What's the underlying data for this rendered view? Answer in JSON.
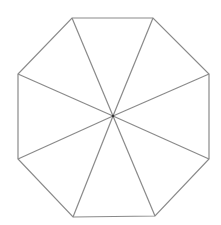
{
  "diagram": {
    "shape": "octagon divided into 8 triangles from center",
    "canvas": {
      "width": 221,
      "height": 225,
      "background": "#ffffff"
    },
    "stroke_color": "#8a8a8a",
    "stroke_width": 1.2,
    "center": [
      113,
      116
    ],
    "vertices": [
      [
        72,
        18
      ],
      [
        153,
        18
      ],
      [
        209,
        74
      ],
      [
        209,
        159
      ],
      [
        155,
        216
      ],
      [
        73,
        217
      ],
      [
        18,
        159
      ],
      [
        18,
        74
      ]
    ]
  }
}
